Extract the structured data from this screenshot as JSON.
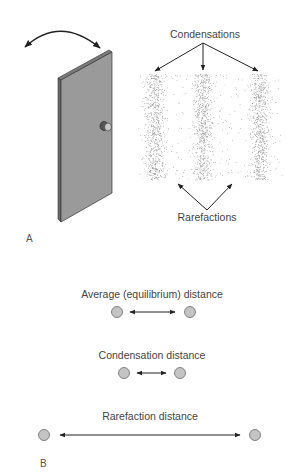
{
  "panel_a": {
    "letter": "A",
    "top_label": "Condensations",
    "bottom_label": "Rarefactions",
    "door_color": "#9a9a9a",
    "particle_color": "#8a8a8a",
    "band_centers_x": [
      155,
      203,
      260
    ]
  },
  "panel_b": {
    "letter": "B",
    "rows": [
      {
        "label": "Average (equilibrium) distance"
      },
      {
        "label": "Condensation distance"
      },
      {
        "label": "Rarefaction distance"
      }
    ],
    "particle_fill": "#c4c4c4",
    "particle_stroke": "#6a6a6a"
  }
}
